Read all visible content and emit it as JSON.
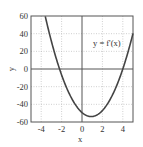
{
  "chart_data": {
    "type": "line",
    "title": "",
    "xlabel": "x",
    "ylabel": "y",
    "xlim": [
      -5,
      5
    ],
    "ylim": [
      -60,
      60
    ],
    "xticks": [
      -4,
      -2,
      0,
      2,
      4
    ],
    "yticks": [
      -60,
      -40,
      -20,
      0,
      20,
      40,
      60
    ],
    "xtick_labels": [
      "-4",
      "-2",
      "0",
      "2",
      "4"
    ],
    "ytick_labels": [
      "-60",
      "-40",
      "-20",
      "0",
      "20",
      "40",
      "60"
    ],
    "grid": true,
    "legend": [],
    "annotations": [
      {
        "text": "y = f'(x)",
        "x": 3.6,
        "y": 28
      }
    ],
    "series": [
      {
        "name": "y = f'(x)",
        "x": [
          -3.6,
          -3,
          -2.2,
          -1,
          0,
          0.9,
          2,
          3,
          4,
          5
        ],
        "y": [
          60,
          39.2,
          0,
          -34.4,
          -49.3,
          -53.8,
          -45.8,
          -29.1,
          0,
          40.3
        ]
      }
    ]
  },
  "labels": {
    "curve_label": "y = f'(x)",
    "x_axis_label": "x",
    "y_axis_label": "y",
    "xticks": [
      "-4",
      "-2",
      "0",
      "2",
      "4"
    ],
    "yticks": [
      "60",
      "40",
      "20",
      "0",
      "-20",
      "-40",
      "-60"
    ]
  }
}
